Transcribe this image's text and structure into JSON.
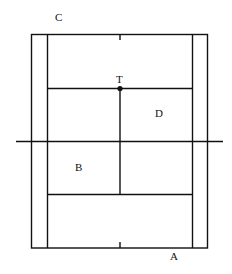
{
  "diagram": {
    "type": "tennis-court",
    "labels": {
      "C": "C",
      "T": "T",
      "D": "D",
      "B": "B",
      "A": "A"
    },
    "colors": {
      "line": "#111111",
      "background": "#ffffff"
    }
  }
}
